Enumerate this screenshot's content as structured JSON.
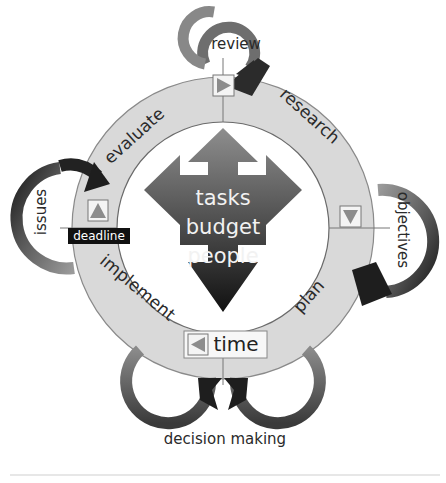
{
  "diagram": {
    "center": {
      "lines": [
        "tasks",
        "budget",
        "people"
      ]
    },
    "ring_segments": [
      {
        "label": "research"
      },
      {
        "label": "plan"
      },
      {
        "label": "implement"
      },
      {
        "label": "evaluate"
      }
    ],
    "loops": {
      "top": "review",
      "right": "objectives",
      "left": "issues",
      "bottom": "decision making"
    },
    "markers": {
      "top_marker": "play-right",
      "right_marker": "triangle-down",
      "left_marker": "triangle-up",
      "bottom_marker": "triangle-left"
    },
    "deadline_label": "deadline",
    "time_label": "time",
    "colors": {
      "ring": "#d9d9d9",
      "ring_edge": "#8a8a8a",
      "arrow_dark": "#2b2b2b",
      "arrow_mid": "#7a7a7a",
      "marker_fill": "#8c8c8c",
      "deadline_bg": "#111111"
    }
  }
}
